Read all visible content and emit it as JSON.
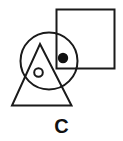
{
  "figure": {
    "label": "C",
    "background_color": "#ffffff",
    "stroke_color": "#1a1a1a",
    "fill_color": "#1a1a1a",
    "shapes": [
      {
        "name": "square",
        "type": "rect",
        "x": 56.5,
        "y": 9.5,
        "width": 58,
        "height": 59,
        "stroke": "#1a1a1a",
        "stroke_width": 2,
        "fill": "none"
      },
      {
        "name": "large-circle",
        "type": "circle",
        "cx": 49,
        "cy": 61,
        "r": 28.5,
        "stroke": "#1a1a1a",
        "stroke_width": 2,
        "fill": "none"
      },
      {
        "name": "triangle",
        "type": "polygon",
        "points": "40,44 71.5,105.5 12,105.5",
        "stroke": "#1a1a1a",
        "stroke_width": 2,
        "fill": "none"
      },
      {
        "name": "filled-dot",
        "type": "circle",
        "cx": 63,
        "cy": 58,
        "r": 5.2,
        "stroke": "none",
        "stroke_width": 0,
        "fill": "#111111"
      },
      {
        "name": "small-circle",
        "type": "circle",
        "cx": 38.5,
        "cy": 72.5,
        "r": 4.3,
        "stroke": "#1a1a1a",
        "stroke_width": 2,
        "fill": "none"
      }
    ]
  }
}
